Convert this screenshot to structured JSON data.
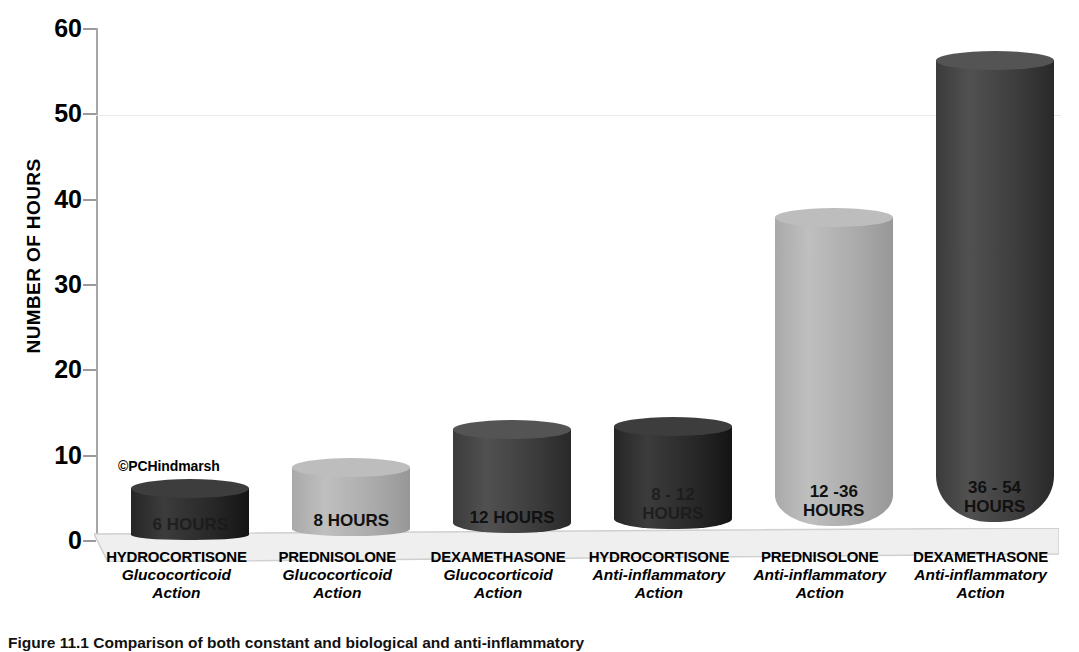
{
  "chart_data": {
    "type": "bar",
    "title": "",
    "xlabel": "",
    "ylabel": "NUMBER OF HOURS",
    "ylim": [
      0,
      60
    ],
    "yticks": [
      0,
      10,
      20,
      30,
      40,
      50,
      60
    ],
    "grid": true,
    "legend": "none",
    "categories": [
      {
        "drug": "HYDROCORTISONE",
        "action_line1": "Glucocorticoid",
        "action_line2": "Action"
      },
      {
        "drug": "PREDNISOLONE",
        "action_line1": "Glucocorticoid",
        "action_line2": "Action"
      },
      {
        "drug": "DEXAMETHASONE",
        "action_line1": "Glucocorticoid",
        "action_line2": "Action"
      },
      {
        "drug": "HYDROCORTISONE",
        "action_line1": "Anti-inflammatory",
        "action_line2": "Action"
      },
      {
        "drug": "PREDNISOLONE",
        "action_line1": "Anti-inflammatory",
        "action_line2": "Action"
      },
      {
        "drug": "DEXAMETHASONE",
        "action_line1": "Anti-inflammatory",
        "action_line2": "Action"
      }
    ],
    "values": [
      6,
      8,
      12,
      12,
      36,
      54
    ],
    "data_labels": [
      "6 HOURS",
      "8 HOURS",
      "12 HOURS",
      "8 - 12\nHOURS",
      "12 -36\nHOURS",
      "36 - 54\nHOURS"
    ],
    "bar_colors": [
      "#262626",
      "#a9a9a9",
      "#3b3b3b",
      "#262626",
      "#a9a9a9",
      "#3b3b3b"
    ],
    "bar_top_colors": [
      "#3d3d3d",
      "#bdbdbd",
      "#545454",
      "#3d3d3d",
      "#bdbdbd",
      "#545454"
    ],
    "label_contrast": [
      "dark",
      "light",
      "light",
      "dark",
      "light",
      "light"
    ]
  },
  "annotations": {
    "copyright": "©PCHindmarsh"
  },
  "caption": {
    "text": "Figure 11.1  Comparison of both constant and biological and anti-inflammatory"
  }
}
